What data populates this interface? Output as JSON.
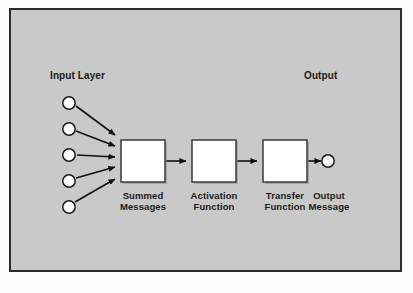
{
  "figure": {
    "type": "neural-unit-flow-diagram",
    "panel_background": "#c9c9c9",
    "frame_color": "#2b2b2b",
    "node_fill": "#ffffff",
    "node_stroke": "#1b1b1b",
    "box_fill": "#ffffff",
    "box_stroke": "#3a3a3a",
    "arrow_color": "#111111"
  },
  "headers": {
    "input": "Input Layer",
    "output": "Output"
  },
  "input_nodes": [
    {
      "id": "input-node-1",
      "cx": 58,
      "cy": 93
    },
    {
      "id": "input-node-2",
      "cx": 58,
      "cy": 119
    },
    {
      "id": "input-node-3",
      "cx": 58,
      "cy": 145
    },
    {
      "id": "input-node-4",
      "cx": 58,
      "cy": 171
    },
    {
      "id": "input-node-5",
      "cx": 58,
      "cy": 197
    }
  ],
  "output_node": {
    "id": "output-node",
    "cx": 317,
    "cy": 150
  },
  "stages": [
    {
      "id": "summed-messages",
      "caption_line1": "Summed",
      "caption_line2": "Messages",
      "x": 110,
      "y": 130,
      "w": 44,
      "h": 42
    },
    {
      "id": "activation-function",
      "caption_line1": "Activation",
      "caption_line2": "Function",
      "x": 181,
      "y": 130,
      "w": 44,
      "h": 42
    },
    {
      "id": "transfer-function",
      "caption_line1": "Transfer",
      "caption_line2": "Function",
      "x": 252,
      "y": 130,
      "w": 44,
      "h": 42
    }
  ],
  "output_caption": {
    "line1": "Output",
    "line2": "Message"
  },
  "captions": {
    "summed": "Summed\nMessages",
    "activation": "Activation\nFunction",
    "transfer": "Transfer\nFunction",
    "output": "Output\nMessage"
  }
}
